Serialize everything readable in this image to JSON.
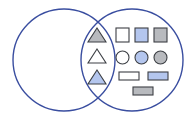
{
  "diagram": {
    "type": "venn",
    "sets": [
      {
        "name": "left-set"
      },
      {
        "name": "right-set"
      }
    ],
    "colors": {
      "outline": "#3a4ea0",
      "shape_stroke": "#3c3f44",
      "white": "#ffffff",
      "blue": "#b4c6ee",
      "gray": "#b8babe"
    },
    "intersection": [
      {
        "shape": "triangle",
        "fill": "gray"
      },
      {
        "shape": "triangle",
        "fill": "white"
      },
      {
        "shape": "triangle",
        "fill": "blue"
      }
    ],
    "right_only": [
      {
        "shape": "square",
        "fill": "white"
      },
      {
        "shape": "square",
        "fill": "blue"
      },
      {
        "shape": "square",
        "fill": "gray"
      },
      {
        "shape": "circle",
        "fill": "white"
      },
      {
        "shape": "circle",
        "fill": "blue"
      },
      {
        "shape": "circle",
        "fill": "gray"
      },
      {
        "shape": "rectangle",
        "fill": "white"
      },
      {
        "shape": "rectangle",
        "fill": "blue"
      },
      {
        "shape": "rectangle",
        "fill": "gray"
      }
    ],
    "left_only": []
  }
}
